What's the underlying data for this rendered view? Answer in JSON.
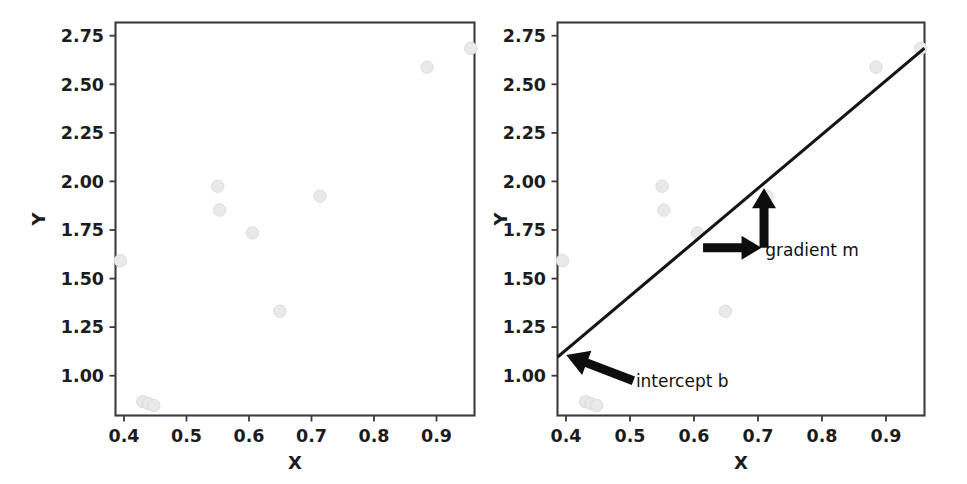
{
  "figure": {
    "background_color": "#ffffff",
    "point_color": "#e9e9e9",
    "line_color": "#151515",
    "arrow_color": "#0d0d0d",
    "axis_color": "#3b3b3b",
    "text_color": "#1c1c1c"
  },
  "chart_data": [
    {
      "type": "scatter",
      "panel": "left",
      "title": "",
      "xlabel": "X",
      "ylabel": "Y",
      "xlim": [
        0.378,
        0.968
      ],
      "ylim": [
        0.855,
        2.835
      ],
      "grid": false,
      "legend": "none",
      "xticks": [
        0.4,
        0.5,
        0.6,
        0.7,
        0.8,
        0.9
      ],
      "xtick_labels": [
        "0.4",
        "0.5",
        "0.6",
        "0.7",
        "0.8",
        "0.9"
      ],
      "yticks": [
        1.0,
        1.25,
        1.5,
        1.75,
        2.0,
        2.25,
        2.5,
        2.75
      ],
      "ytick_labels": [
        "1.00",
        "1.25",
        "1.50",
        "1.75",
        "2.00",
        "2.25",
        "2.50",
        "2.75"
      ],
      "x": [
        0.386,
        0.423,
        0.432,
        0.441,
        0.546,
        0.549,
        0.603,
        0.648,
        0.714,
        0.89,
        0.962
      ],
      "y": [
        1.635,
        0.925,
        0.915,
        0.905,
        2.01,
        1.89,
        1.775,
        1.38,
        1.96,
        2.61,
        2.705
      ],
      "has_fit_line": false,
      "annotations": []
    },
    {
      "type": "scatter",
      "panel": "right",
      "title": "",
      "xlabel": "X",
      "ylabel": "Y",
      "xlim": [
        0.378,
        0.968
      ],
      "ylim": [
        0.855,
        2.835
      ],
      "grid": false,
      "legend": "none",
      "xticks": [
        0.4,
        0.5,
        0.6,
        0.7,
        0.8,
        0.9
      ],
      "xtick_labels": [
        "0.4",
        "0.5",
        "0.6",
        "0.7",
        "0.8",
        "0.9"
      ],
      "yticks": [
        1.0,
        1.25,
        1.5,
        1.75,
        2.0,
        2.25,
        2.5,
        2.75
      ],
      "ytick_labels": [
        "1.00",
        "1.25",
        "1.50",
        "1.75",
        "2.00",
        "2.25",
        "2.50",
        "2.75"
      ],
      "x": [
        0.386,
        0.423,
        0.432,
        0.441,
        0.546,
        0.549,
        0.603,
        0.648,
        0.714,
        0.89,
        0.962
      ],
      "y": [
        1.635,
        0.925,
        0.915,
        0.905,
        2.01,
        1.89,
        1.775,
        1.38,
        1.96,
        2.61,
        2.705
      ],
      "has_fit_line": true,
      "fit_line": {
        "x_start": 0.386,
        "y_start": 1.17,
        "x_end": 0.962,
        "y_end": 2.69,
        "slope": 2.64,
        "intercept": 0.151
      },
      "annotations": [
        {
          "label": "gradient m",
          "kind": "double-arrow-run-rise",
          "run_arrow_from": [
            0.612,
            1.7
          ],
          "run_arrow_to": [
            0.706,
            1.7
          ],
          "rise_arrow_from": [
            0.71,
            1.7
          ],
          "rise_arrow_to": [
            0.71,
            2.0
          ],
          "text_at": [
            0.712,
            1.66
          ]
        },
        {
          "label": "intercept b",
          "kind": "single-arrow",
          "arrow_from": [
            0.5,
            1.03
          ],
          "arrow_to": [
            0.392,
            1.16
          ],
          "text_at": [
            0.504,
            1.0
          ]
        }
      ]
    }
  ],
  "labels": {
    "x_axis": "X",
    "y_axis": "Y",
    "gradient": "gradient m",
    "intercept": "intercept b"
  },
  "xtick_labels": [
    "0.4",
    "0.5",
    "0.6",
    "0.7",
    "0.8",
    "0.9"
  ],
  "ytick_labels": [
    "1.00",
    "1.25",
    "1.50",
    "1.75",
    "2.00",
    "2.25",
    "2.50",
    "2.75"
  ]
}
